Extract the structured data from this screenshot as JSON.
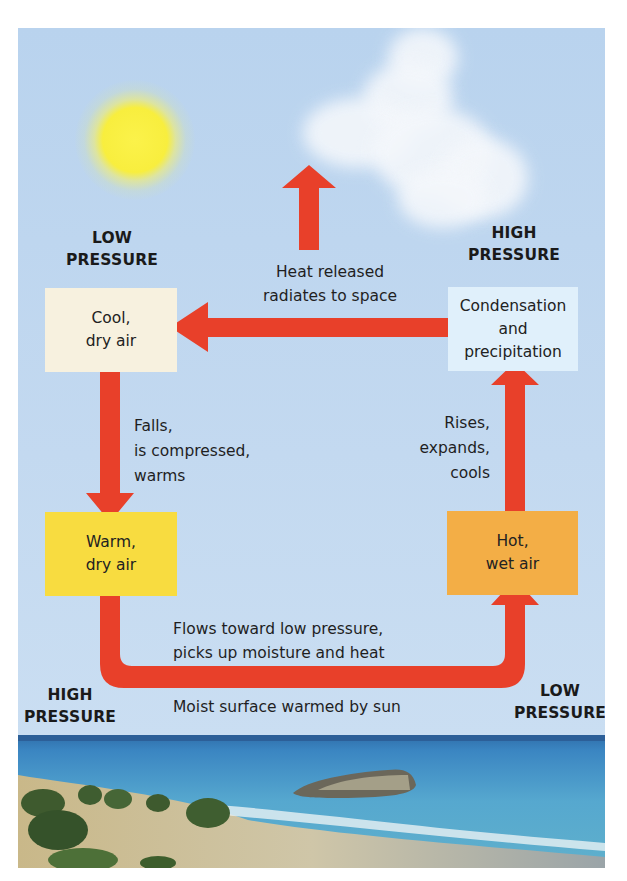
{
  "diagram": {
    "title_hidden": "",
    "pressure_labels": {
      "top_left": [
        "LOW",
        "PRESSURE"
      ],
      "top_right": [
        "HIGH",
        "PRESSURE"
      ],
      "bottom_left": [
        "HIGH",
        "PRESSURE"
      ],
      "bottom_right": [
        "LOW",
        "PRESSURE"
      ]
    },
    "boxes": {
      "cool": {
        "lines": [
          "Cool,",
          "dry air"
        ],
        "color": "#f7f1df"
      },
      "condensation": {
        "lines": [
          "Condensation",
          "and",
          "precipitation"
        ],
        "color": "#e0f0fb"
      },
      "warm": {
        "lines": [
          "Warm,",
          "dry air"
        ],
        "color": "#f8dc40"
      },
      "hot": {
        "lines": [
          "Hot,",
          "wet air"
        ],
        "color": "#f3ae46"
      }
    },
    "annotations": {
      "heat": [
        "Heat released",
        "radiates to space"
      ],
      "falls": [
        "Falls,",
        "is compressed,",
        "warms"
      ],
      "rises": [
        "Rises,",
        "expands,",
        "cools"
      ],
      "flows": [
        "Flows toward low pressure,",
        "picks up moisture and heat"
      ],
      "surface": "Moist surface warmed by sun"
    },
    "arrow_color": "#e8402a",
    "sky_color": "#bcd5ee"
  }
}
